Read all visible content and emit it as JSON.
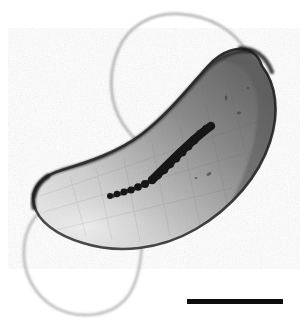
{
  "figure": {
    "kind": "transmission-electron-micrograph",
    "specimen": "curved rod-shaped bacterial cell with bipolar flagella and an intracellular chain of electron-dense granules",
    "background_color": "#ffffff",
    "width_px": 304,
    "height_px": 327
  },
  "cell": {
    "name": "bacterial-cell-body",
    "shape": "vibrioid-curved-rod",
    "fill_light": "#d9d9d9",
    "fill_mid": "#9a9a9a",
    "fill_dark": "#6d6d6d",
    "outline_color": "#2a2a2a",
    "long_axis_orientation_deg": -35,
    "pole_top_right": {
      "x": 262,
      "y": 70
    },
    "pole_bottom_left": {
      "x": 38,
      "y": 205
    }
  },
  "magnetosome_chain": {
    "name": "electron-dense-granule-chain",
    "color": "#141414",
    "granule_count": 16,
    "granules": [
      {
        "x": 110,
        "y": 196,
        "r": 3.0
      },
      {
        "x": 117,
        "y": 194,
        "r": 3.2
      },
      {
        "x": 124,
        "y": 192,
        "r": 3.4
      },
      {
        "x": 131,
        "y": 190,
        "r": 3.6
      },
      {
        "x": 138,
        "y": 187,
        "r": 3.8
      },
      {
        "x": 145,
        "y": 184,
        "r": 4.0
      },
      {
        "x": 152,
        "y": 180,
        "r": 4.1
      },
      {
        "x": 158,
        "y": 175,
        "r": 4.2
      },
      {
        "x": 164,
        "y": 170,
        "r": 4.3
      },
      {
        "x": 170,
        "y": 164,
        "r": 4.4
      },
      {
        "x": 176,
        "y": 158,
        "r": 4.5
      },
      {
        "x": 182,
        "y": 152,
        "r": 4.6
      },
      {
        "x": 188,
        "y": 146,
        "r": 4.6
      },
      {
        "x": 194,
        "y": 140,
        "r": 4.5
      },
      {
        "x": 200,
        "y": 134,
        "r": 4.3
      },
      {
        "x": 206,
        "y": 129,
        "r": 3.9
      }
    ]
  },
  "flagella": [
    {
      "name": "upper-flagellum",
      "color": "#bdbdbd",
      "attachment": {
        "x": 247,
        "y": 52
      },
      "description": "long filament looping up and to the left above the cell"
    },
    {
      "name": "lower-flagellum",
      "color": "#c4c4c4",
      "attachment": {
        "x": 142,
        "y": 243
      },
      "description": "long filament looping down and to the left below the cell"
    }
  ],
  "scale_bar": {
    "name": "scale-bar",
    "color": "#0d0d0d",
    "left_px": 187,
    "top_px": 299,
    "width_px": 96,
    "height_px": 5,
    "label": ""
  }
}
